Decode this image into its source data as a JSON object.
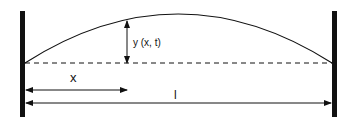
{
  "diagram": {
    "type": "vibrating string fixed at both ends",
    "labels": {
      "displacement": "y (x, t)",
      "position": "x",
      "length": "l"
    },
    "colors": {
      "stroke": "#111111",
      "background": "#ffffff"
    }
  }
}
